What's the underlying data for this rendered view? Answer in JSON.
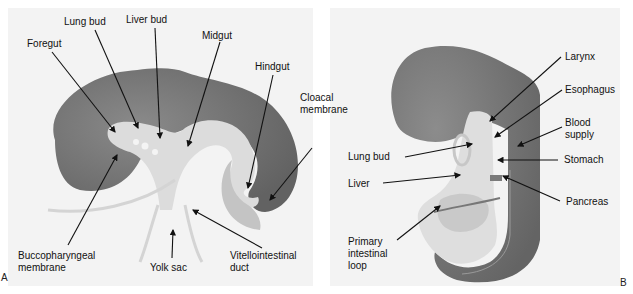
{
  "figure": {
    "panels": [
      {
        "id": "A",
        "letter": "A",
        "labels": {
          "foregut": "Foregut",
          "lung_bud": "Lung bud",
          "liver_bud": "Liver bud",
          "midgut": "Midgut",
          "hindgut": "Hindgut",
          "cloacal_membrane": "Cloacal\nmembrane",
          "buccopharyngeal_membrane": "Buccopharyngeal\nmembrane",
          "yolk_sac": "Yolk sac",
          "vitellointestinal_duct": "Vitellointestinal\nduct"
        }
      },
      {
        "id": "B",
        "letter": "B",
        "labels": {
          "larynx": "Larynx",
          "esophagus": "Esophagus",
          "blood_supply": "Blood\nsupply",
          "lung_bud": "Lung bud",
          "stomach": "Stomach",
          "liver": "Liver",
          "pancreas": "Pancreas",
          "primary_intestinal_loop": "Primary\nintestinal\nloop"
        }
      }
    ],
    "colors": {
      "background": "#f3f3f3",
      "embryo_dark": "#6e6e6e",
      "gut_light": "#d9d9d9",
      "gut_mid": "#bdbdbd",
      "arrow": "#111111"
    }
  }
}
